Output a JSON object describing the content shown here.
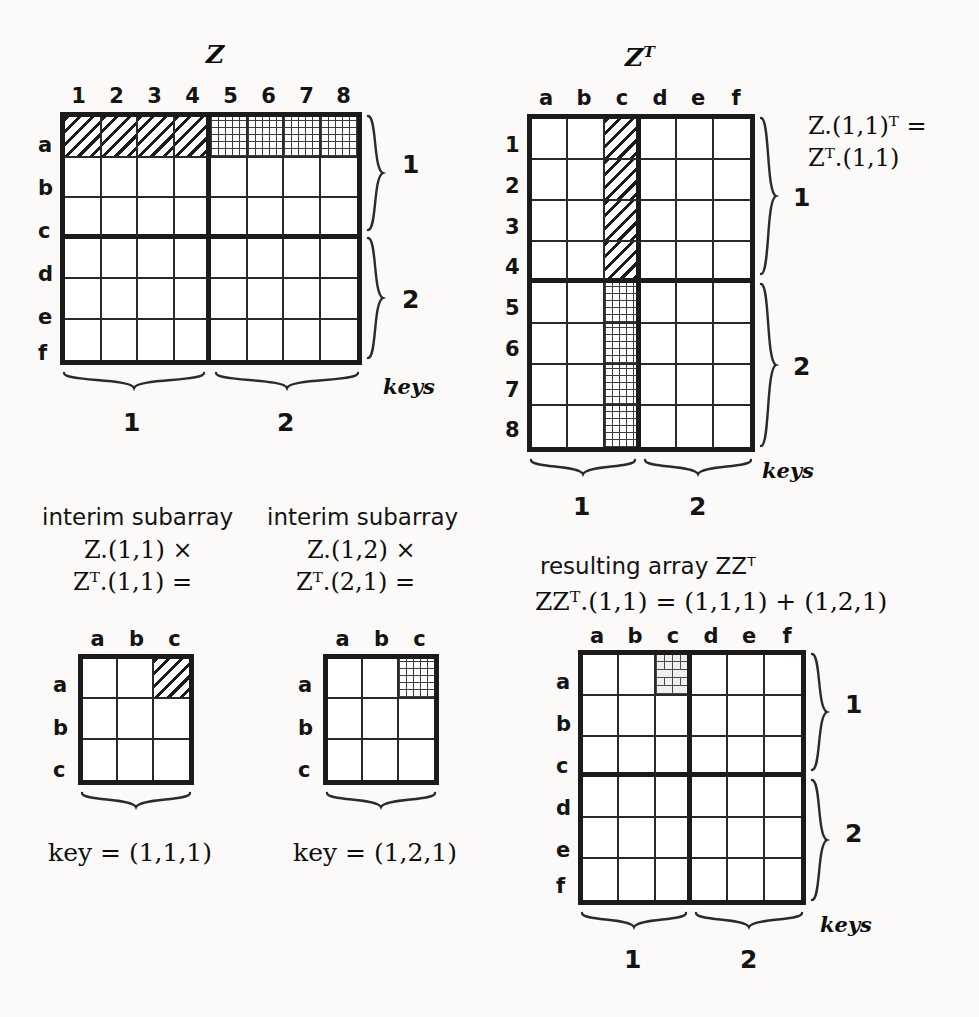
{
  "figure": {
    "kind": "matrix-multiplication-blocking-diagram"
  },
  "panel_z": {
    "title": "Z",
    "col_headers": [
      "1",
      "2",
      "3",
      "4",
      "5",
      "6",
      "7",
      "8"
    ],
    "row_headers": [
      "a",
      "b",
      "c",
      "d",
      "e",
      "f"
    ],
    "row_group_labels": [
      "1",
      "2"
    ],
    "col_group_labels": [
      "1",
      "2"
    ],
    "keys_label": "keys",
    "highlight_diag_cells": "row a, cols 1-4",
    "highlight_mesh_cells": "row a, cols 5-8"
  },
  "panel_zt": {
    "title": "Zᵀ",
    "col_headers": [
      "a",
      "b",
      "c",
      "d",
      "e",
      "f"
    ],
    "row_headers": [
      "1",
      "2",
      "3",
      "4",
      "5",
      "6",
      "7",
      "8"
    ],
    "row_group_labels": [
      "1",
      "2"
    ],
    "col_group_labels": [
      "1",
      "2"
    ],
    "keys_label": "keys",
    "equation_line1": "Z.(1,1)ᵀ =",
    "equation_line2": "Zᵀ.(1,1)",
    "highlight_diag_cells": "col c, rows 1-4",
    "highlight_mesh_cells": "col c, rows 5-8"
  },
  "panel_interim_1": {
    "caption_line1": "interim subarray",
    "caption_line2": "Z.(1,1) ×",
    "caption_line3": "Zᵀ.(1,1) =",
    "col_headers": [
      "a",
      "b",
      "c"
    ],
    "row_headers": [
      "a",
      "b",
      "c"
    ],
    "highlight_diag_cells": "row a, col c",
    "key_text": "key = (1,1,1)"
  },
  "panel_interim_2": {
    "caption_line1": "interim subarray",
    "caption_line2": "Z.(1,2) ×",
    "caption_line3": "Zᵀ.(2,1) =",
    "col_headers": [
      "a",
      "b",
      "c"
    ],
    "row_headers": [
      "a",
      "b",
      "c"
    ],
    "highlight_mesh_cells": "row a, col c",
    "key_text": "key = (1,2,1)"
  },
  "panel_result": {
    "caption_line1": "resulting array ZZᵀ",
    "caption_line2": "ZZᵀ.(1,1) = (1,1,1) + (1,2,1)",
    "col_headers": [
      "a",
      "b",
      "c",
      "d",
      "e",
      "f"
    ],
    "row_headers": [
      "a",
      "b",
      "c",
      "d",
      "e",
      "f"
    ],
    "row_group_labels": [
      "1",
      "2"
    ],
    "col_group_labels": [
      "1",
      "2"
    ],
    "keys_label": "keys",
    "highlight_brick_cells": "row a, col c"
  },
  "colors": {
    "ink": "#141414",
    "rule_heavy": "#1b1b1b",
    "rule_light": "#2a2a2a",
    "paper": "#fbfaf8"
  }
}
